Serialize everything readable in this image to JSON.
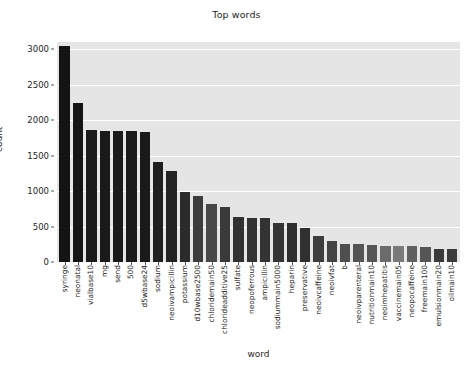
{
  "chart_data": {
    "type": "bar",
    "title": "Top words",
    "xlabel": "word",
    "ylabel": "count",
    "ylim": [
      0,
      3100
    ],
    "yticks": [
      0,
      500,
      1000,
      1500,
      2000,
      2500,
      3000
    ],
    "ytick_labels": [
      "0",
      "500",
      "1000",
      "1500",
      "2000",
      "2500",
      "3000"
    ],
    "grid": true,
    "legend": null,
    "plot_background": "#e5e5e5",
    "gridline_color": "#ffffff",
    "categories": [
      "syringe",
      "neonatal",
      "vialbase10",
      "mg",
      "send",
      "500",
      "d5wbase24",
      "sodium",
      "neoivampicillin",
      "potassium",
      "d10wbase2500",
      "chloridemain50",
      "chlorideadditive25",
      "sulfate",
      "neopoferrous",
      "ampicillin",
      "sodiummain5000",
      "heparin",
      "preservative",
      "neoivcaffeine",
      "neoivfat",
      "b",
      "neoivparenteral",
      "nutritionmain10",
      "neoimhepatitis",
      "vaccinemain05",
      "neopocaffeine",
      "freemain100",
      "emulsionmain20",
      "oilmain10"
    ],
    "values": [
      3040,
      2240,
      1860,
      1850,
      1850,
      1850,
      1835,
      1415,
      1285,
      985,
      935,
      820,
      770,
      630,
      615,
      620,
      555,
      550,
      480,
      365,
      300,
      255,
      250,
      245,
      225,
      225,
      220,
      215,
      190,
      190
    ],
    "bar_colors": [
      "#141414",
      "#141414",
      "#1a1a1a",
      "#1a1a1a",
      "#1a1a1a",
      "#1a1a1a",
      "#1a1a1a",
      "#1f1f1f",
      "#232323",
      "#2b2b2b",
      "#3c3c3c",
      "#484848",
      "#3a3a3a",
      "#313131",
      "#333333",
      "#333333",
      "#343434",
      "#2e2e2e",
      "#303030",
      "#3d3d3d",
      "#434343",
      "#4f4f4f",
      "#545454",
      "#555555",
      "#6b6b6b",
      "#7a7a7a",
      "#616161",
      "#565656",
      "#3b3b3b",
      "#3b3b3b"
    ]
  }
}
